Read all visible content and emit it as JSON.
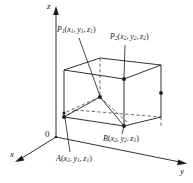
{
  "figure": {
    "colors": {
      "stroke": "#1a1a1a",
      "background": "#ffffff",
      "dashed": "#555555"
    },
    "axes": [
      {
        "name": "z-axis",
        "label": "z",
        "direction": "up"
      },
      {
        "name": "y-axis",
        "label": "y",
        "direction": "right"
      },
      {
        "name": "x-axis",
        "label": "x",
        "direction": "lower-left"
      }
    ],
    "origin": {
      "label": "0"
    },
    "points": [
      {
        "name": "P1",
        "base": "P",
        "base_sub": "1",
        "coords": "(x₁, y₁, z₁)",
        "label": "P₁(x₁, y₁, z₁)",
        "coord_parts": [
          {
            "var": "x",
            "sub": "1"
          },
          {
            "var": "y",
            "sub": "1"
          },
          {
            "var": "z",
            "sub": "1"
          }
        ]
      },
      {
        "name": "P2",
        "base": "P",
        "base_sub": "2",
        "coords": "(x₂, y₂, z₂)",
        "label": "P₂(x₂, y₂, z₂)",
        "coord_parts": [
          {
            "var": "x",
            "sub": "2"
          },
          {
            "var": "y",
            "sub": "2"
          },
          {
            "var": "z",
            "sub": "2"
          }
        ]
      },
      {
        "name": "A",
        "base": "A",
        "base_sub": "",
        "coords": "(x₂, y₁, z₁)",
        "label": "A(x₂, y₁, z₁)",
        "coord_parts": [
          {
            "var": "x",
            "sub": "2"
          },
          {
            "var": "y",
            "sub": "1"
          },
          {
            "var": "z",
            "sub": "1"
          }
        ]
      },
      {
        "name": "B",
        "base": "B",
        "base_sub": "",
        "coords": "(x₂, y₂, z₁)",
        "label": "B(x₂, y₂, z₁)",
        "coord_parts": [
          {
            "var": "x",
            "sub": "2"
          },
          {
            "var": "y",
            "sub": "2"
          },
          {
            "var": "z",
            "sub": "1"
          }
        ]
      }
    ],
    "labels": {
      "z": "z",
      "y": "y",
      "x": "x",
      "origin": "0",
      "p1_base": "P",
      "p1_sub": "1",
      "p2_base": "P",
      "p2_sub": "2",
      "a_base": "A",
      "b_base": "B",
      "open_paren": "(",
      "close_paren": ")",
      "comma": ",",
      "var_x": "x",
      "var_y": "y",
      "var_z": "z",
      "sub_1": "1",
      "sub_2": "2"
    }
  }
}
